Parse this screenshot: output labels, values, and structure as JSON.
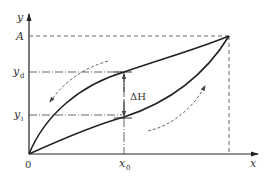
{
  "diagram": {
    "type": "hysteresis-curve",
    "axes": {
      "x_label": "x",
      "y_label": "y",
      "origin_label": "0"
    },
    "labels": {
      "max_output": "A",
      "y_decreasing": "y",
      "y_decreasing_sub": "d",
      "y_increasing": "y",
      "y_increasing_sub": "i",
      "x_point": "x",
      "x_point_sub": "0",
      "hysteresis": "ΔH"
    },
    "curves": [
      {
        "name": "upper-curve",
        "direction": "unloading (decreasing)"
      },
      {
        "name": "lower-curve",
        "direction": "loading (increasing)"
      }
    ],
    "colors": {
      "curve": "#222222",
      "guide": "#555555",
      "background": "#ffffff"
    }
  }
}
